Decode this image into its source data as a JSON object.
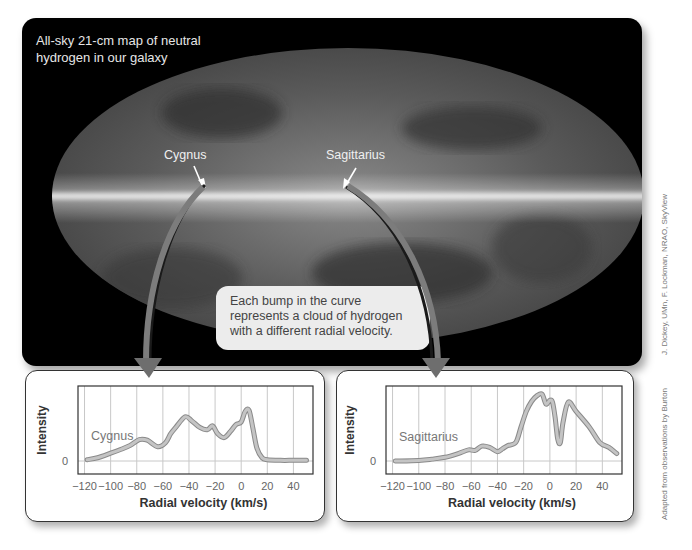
{
  "map": {
    "title": "All-sky 21-cm map of neutral hydrogen in our galaxy",
    "title_line1": "All-sky 21-cm map of neutral",
    "title_line2": "hydrogen in our galaxy",
    "labels": {
      "cygnus": "Cygnus",
      "sagittarius": "Sagittarius"
    }
  },
  "callout": {
    "line1": "Each bump in the curve",
    "line2": "represents a cloud of hydrogen",
    "line3": "with a different radial velocity."
  },
  "credits": {
    "map": "J. Dickey, UMn, F. Lockman, NRAO, SkyView",
    "graphs": "Adapted from observations by Burton"
  },
  "colors": {
    "background": "#ffffff",
    "map_bg": "#000000",
    "curve": "#b8b8b8",
    "arrow": "#7a7a7a"
  },
  "chart_data": [
    {
      "type": "line",
      "title": "Cygnus",
      "xlabel": "Radial velocity (km/s)",
      "ylabel": "Intensity",
      "xlim": [
        -125,
        55
      ],
      "x_ticks": [
        -120,
        -100,
        -80,
        -60,
        -40,
        -20,
        0,
        20,
        40
      ],
      "x_tick_labels": [
        "−120",
        "−100",
        "−80",
        "−60",
        "−40",
        "−20",
        "0",
        "20",
        "40"
      ],
      "y_ticks": [
        0
      ],
      "y_tick_labels": [
        "0"
      ],
      "grid": "vertical",
      "series": [
        {
          "name": "Cygnus",
          "x": [
            -118,
            -110,
            -100,
            -92,
            -85,
            -78,
            -72,
            -64,
            -58,
            -54,
            -50,
            -43,
            -38,
            -32,
            -26,
            -22,
            -18,
            -13,
            -8,
            -4,
            0,
            3,
            6,
            9,
            12,
            16,
            20,
            30,
            40,
            50
          ],
          "y": [
            0.02,
            0.05,
            0.12,
            0.18,
            0.24,
            0.33,
            0.32,
            0.22,
            0.28,
            0.42,
            0.52,
            0.68,
            0.62,
            0.52,
            0.48,
            0.54,
            0.42,
            0.36,
            0.46,
            0.56,
            0.6,
            0.76,
            0.78,
            0.5,
            0.2,
            0.05,
            0.02,
            0.01,
            0.01,
            0.01
          ]
        }
      ]
    },
    {
      "type": "line",
      "title": "Sagittarius",
      "xlabel": "Radial velocity (km/s)",
      "ylabel": "Intensity",
      "xlim": [
        -125,
        55
      ],
      "x_ticks": [
        -120,
        -100,
        -80,
        -60,
        -40,
        -20,
        0,
        20,
        40
      ],
      "x_tick_labels": [
        "−120",
        "−100",
        "−80",
        "−60",
        "−40",
        "−20",
        "0",
        "20",
        "40"
      ],
      "y_ticks": [
        0
      ],
      "y_tick_labels": [
        "0"
      ],
      "grid": "vertical",
      "series": [
        {
          "name": "Sagittarius",
          "x": [
            -118,
            -100,
            -90,
            -80,
            -70,
            -62,
            -57,
            -52,
            -46,
            -40,
            -36,
            -32,
            -26,
            -22,
            -18,
            -14,
            -10,
            -6,
            -3,
            0,
            2,
            4,
            6,
            8,
            10,
            14,
            20,
            30,
            38,
            45,
            51
          ],
          "y": [
            0.0,
            0.01,
            0.03,
            0.06,
            0.12,
            0.18,
            0.17,
            0.24,
            0.22,
            0.15,
            0.2,
            0.25,
            0.3,
            0.55,
            0.8,
            0.96,
            1.05,
            1.08,
            0.92,
            0.98,
            0.95,
            0.7,
            0.35,
            0.3,
            0.62,
            0.95,
            0.8,
            0.55,
            0.3,
            0.22,
            0.12
          ]
        }
      ]
    }
  ]
}
